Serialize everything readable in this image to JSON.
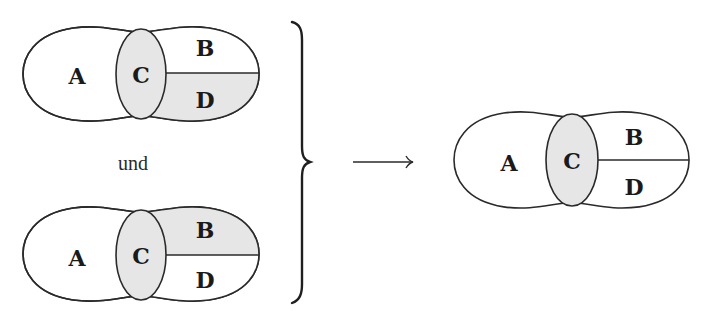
{
  "colors": {
    "shade": "#e6e6e6",
    "unshaded": "#ffffff",
    "stroke": "#2a2a2a"
  },
  "connector_text": "und",
  "diagrams": [
    {
      "id": "premise-1",
      "labels": {
        "A": "A",
        "B": "B",
        "C": "C",
        "D": "D"
      },
      "shaded_regions": [
        "C",
        "D"
      ]
    },
    {
      "id": "premise-2",
      "labels": {
        "A": "A",
        "B": "B",
        "C": "C",
        "D": "D"
      },
      "shaded_regions": [
        "C",
        "B"
      ]
    },
    {
      "id": "conclusion",
      "labels": {
        "A": "A",
        "B": "B",
        "C": "C",
        "D": "D"
      },
      "shaded_regions": [
        "C"
      ]
    }
  ],
  "symbols": {
    "brace": "right-curly-brace",
    "arrow": "long-right-arrow"
  }
}
